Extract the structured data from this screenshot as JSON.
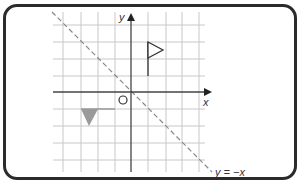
{
  "diagram": {
    "type": "coordinate-reflection",
    "axes": {
      "x_label": "x",
      "y_label": "y",
      "origin_label": "O"
    },
    "mirror_line": {
      "label": "y = −x",
      "style": "dashed"
    },
    "shapes": {
      "object": "flag",
      "image": "reflected flag (filled triangle)"
    },
    "colors": {
      "frame": "#2b2b2b",
      "grid": "#c8c8c8",
      "axis": "#444444",
      "mirror_line": "#888888",
      "flag": "#333333",
      "image_fill": "#9a9a9a"
    }
  }
}
